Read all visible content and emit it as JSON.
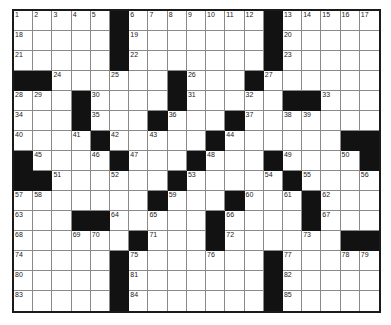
{
  "puzzle": {
    "type": "crossword",
    "columns": 19,
    "rows_count": 15,
    "colors": {
      "block": "#121212",
      "cell": "#ffffff",
      "grid_line": "#8a8a8a",
      "border": "#1a1a1a",
      "number": "#222222"
    },
    "legend": "# = black square, . = empty white square, number = clue-numbered white square",
    "rows": [
      [
        "1",
        "2",
        "3",
        "4",
        "5",
        "#",
        "6",
        "7",
        "8",
        "9",
        "10",
        "11",
        "12",
        "#",
        "13",
        "14",
        "15",
        "16",
        "17"
      ],
      [
        "18",
        ".",
        ".",
        ".",
        ".",
        "#",
        "19",
        ".",
        ".",
        ".",
        ".",
        ".",
        ".",
        "#",
        "20",
        ".",
        ".",
        ".",
        "."
      ],
      [
        "21",
        ".",
        ".",
        ".",
        ".",
        "#",
        "22",
        ".",
        ".",
        ".",
        ".",
        ".",
        ".",
        "#",
        "23",
        ".",
        ".",
        ".",
        "."
      ],
      [
        "#",
        "#",
        "24",
        ".",
        ".",
        "25",
        ".",
        ".",
        "#",
        "26",
        ".",
        ".",
        "#",
        "27",
        ".",
        ".",
        ".",
        ".",
        "."
      ],
      [
        "28",
        "29",
        ".",
        "#",
        "30",
        ".",
        ".",
        ".",
        "#",
        "31",
        ".",
        ".",
        "32",
        ".",
        "#",
        "#",
        "33",
        ".",
        "."
      ],
      [
        "34",
        ".",
        ".",
        "#",
        "35",
        ".",
        ".",
        "#",
        "36",
        ".",
        ".",
        "#",
        "37",
        ".",
        "38",
        "39",
        ".",
        ".",
        "."
      ],
      [
        "40",
        ".",
        ".",
        "41",
        "#",
        "42",
        ".",
        "43",
        ".",
        ".",
        "#",
        "44",
        ".",
        ".",
        ".",
        ".",
        ".",
        "#",
        "#"
      ],
      [
        "#",
        "45",
        ".",
        ".",
        "46",
        "#",
        "47",
        ".",
        ".",
        "#",
        "48",
        ".",
        ".",
        "#",
        "49",
        ".",
        ".",
        "50",
        "#"
      ],
      [
        "#",
        "#",
        "51",
        ".",
        ".",
        "52",
        ".",
        ".",
        "#",
        "53",
        ".",
        ".",
        ".",
        "54",
        "#",
        "55",
        ".",
        ".",
        "56"
      ],
      [
        "57",
        "58",
        ".",
        ".",
        ".",
        ".",
        ".",
        "#",
        "59",
        ".",
        ".",
        "#",
        "60",
        ".",
        "61",
        "#",
        "62",
        ".",
        "."
      ],
      [
        "63",
        ".",
        ".",
        "#",
        "#",
        "64",
        ".",
        "65",
        ".",
        ".",
        "#",
        "66",
        ".",
        ".",
        ".",
        "#",
        "67",
        ".",
        "."
      ],
      [
        "68",
        ".",
        ".",
        "69",
        "70",
        ".",
        "#",
        "71",
        ".",
        ".",
        "#",
        "72",
        ".",
        ".",
        ".",
        "73",
        ".",
        "#",
        "#"
      ],
      [
        "74",
        ".",
        ".",
        ".",
        ".",
        "#",
        "75",
        ".",
        ".",
        ".",
        "76",
        ".",
        ".",
        "#",
        "77",
        ".",
        ".",
        "78",
        "79"
      ],
      [
        "80",
        ".",
        ".",
        ".",
        ".",
        "#",
        "81",
        ".",
        ".",
        ".",
        ".",
        ".",
        ".",
        "#",
        "82",
        ".",
        ".",
        ".",
        "."
      ],
      [
        "83",
        ".",
        ".",
        ".",
        ".",
        "#",
        "84",
        ".",
        ".",
        ".",
        ".",
        ".",
        ".",
        "#",
        "85",
        ".",
        ".",
        ".",
        "."
      ]
    ]
  }
}
